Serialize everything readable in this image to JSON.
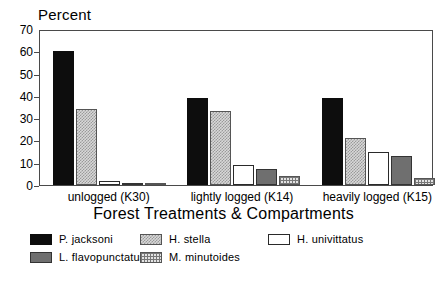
{
  "chart_data": {
    "type": "bar",
    "title": "",
    "ylabel": "Percent",
    "xlabel": "Forest Treatments & Compartments",
    "ylim": [
      0,
      70
    ],
    "yticks": [
      0,
      10,
      20,
      30,
      40,
      50,
      60,
      70
    ],
    "grid": false,
    "legend_position": "bottom",
    "categories": [
      "unlogged (K30)",
      "lightly logged (K14)",
      "heavily logged (K15)"
    ],
    "series": [
      {
        "name": "P. jacksoni",
        "fill": "solid-black",
        "color": "#0d0d0d",
        "values": [
          60,
          39,
          39
        ]
      },
      {
        "name": "H. stella",
        "fill": "checker-light",
        "color": "#d8d8d8",
        "values": [
          34,
          33,
          21
        ]
      },
      {
        "name": "H. univittatus",
        "fill": "white",
        "color": "#ffffff",
        "values": [
          2,
          9,
          15
        ]
      },
      {
        "name": "L. flavopunctatus",
        "fill": "dark-gray",
        "color": "#6f6f6f",
        "values": [
          1,
          7,
          13
        ]
      },
      {
        "name": "M. minutoides",
        "fill": "grid",
        "color": "#e3e3e3",
        "values": [
          1,
          4,
          3
        ]
      }
    ]
  },
  "legend": {
    "items": [
      {
        "label": "P. jacksoni",
        "fill": "solid-black"
      },
      {
        "label": "H. stella",
        "fill": "checker-light"
      },
      {
        "label": "H. univittatus",
        "fill": "white"
      },
      {
        "label": "L. flavopunctatus",
        "fill": "dark-gray"
      },
      {
        "label": "M. minutoides",
        "fill": "grid"
      }
    ]
  }
}
